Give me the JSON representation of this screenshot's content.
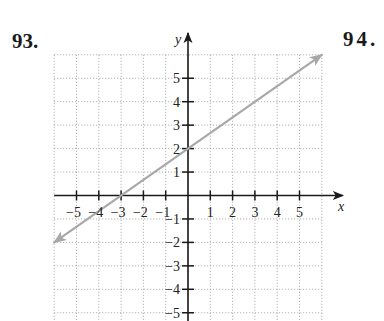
{
  "problems": {
    "left_number": "93.",
    "right_number": "94."
  },
  "chart_data": {
    "type": "line",
    "title": "",
    "xlabel": "x",
    "ylabel": "y",
    "xlim": [
      -6,
      6
    ],
    "ylim": [
      -5,
      6
    ],
    "grid": true,
    "grid_style": "dotted",
    "x_ticks": [
      -5,
      -4,
      -3,
      -2,
      -1,
      1,
      2,
      3,
      4,
      5
    ],
    "y_ticks": [
      -5,
      -4,
      -3,
      -2,
      -1,
      1,
      2,
      3,
      4,
      5
    ],
    "x_tick_labels": [
      "−5",
      "−4",
      "−3",
      "−2",
      "−1",
      "1",
      "2",
      "3",
      "4",
      "5"
    ],
    "y_tick_labels": [
      "−5",
      "−4",
      "−3",
      "−2",
      "−1",
      "1",
      "2",
      "3",
      "4",
      "5"
    ],
    "series": [
      {
        "name": "line",
        "equation": "y = (2/3)x + 2",
        "slope": 0.6667,
        "y_intercept": 2,
        "x_intercept": -3,
        "x": [
          -6,
          -3,
          0,
          3,
          6
        ],
        "y": [
          -2,
          0,
          2,
          4,
          6
        ],
        "arrows_both_ends": true,
        "color": "#a8a8a8"
      }
    ],
    "legend": null
  },
  "colors": {
    "axis": "#1a1a1a",
    "grid": "#9a9a9a",
    "line": "#a8a8a8"
  }
}
